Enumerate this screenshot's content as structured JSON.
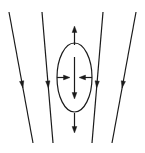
{
  "figure": {
    "width": 145,
    "height": 153,
    "background_color": "#ffffff",
    "stroke_color": "#1a1a1a",
    "line_width": 1.2
  },
  "field_lines": {
    "label": "field-lines",
    "count": 4,
    "stroke_color": "#1a1a1a",
    "lines": [
      {
        "name": "field-line-1",
        "x1": 9,
        "y1": 12,
        "x2": 33,
        "y2": 143,
        "arrow_t": 0.58,
        "direction": "down"
      },
      {
        "name": "field-line-2",
        "x1": 42,
        "y1": 12,
        "x2": 53,
        "y2": 143,
        "arrow_t": 0.58,
        "direction": "down"
      },
      {
        "name": "field-line-3",
        "x1": 103,
        "y1": 12,
        "x2": 92,
        "y2": 143,
        "arrow_t": 0.58,
        "direction": "down"
      },
      {
        "name": "field-line-4",
        "x1": 136,
        "y1": 12,
        "x2": 112,
        "y2": 143,
        "arrow_t": 0.58,
        "direction": "down"
      }
    ]
  },
  "ellipse": {
    "name": "deformation-ellipse",
    "cx": 74.5,
    "cy": 77.5,
    "rx": 17.5,
    "ry": 34.5,
    "fill": "none",
    "stroke_color": "#1a1a1a"
  },
  "force_arrows": {
    "label": "force-arrows",
    "arrows": [
      {
        "name": "arrow-up-outside",
        "x1": 74.5,
        "y1": 45,
        "x2": 74.5,
        "y2": 26,
        "direction": "up",
        "position": "above-ellipse"
      },
      {
        "name": "arrow-down-outside",
        "x1": 74.5,
        "y1": 113,
        "x2": 74.5,
        "y2": 133,
        "direction": "down",
        "position": "below-ellipse"
      },
      {
        "name": "arrow-down-inside",
        "x1": 74.5,
        "y1": 57,
        "x2": 74.5,
        "y2": 99,
        "direction": "down",
        "position": "inside-ellipse-vertical"
      },
      {
        "name": "arrow-left-inward",
        "x1": 57,
        "y1": 77.5,
        "x2": 70,
        "y2": 77.5,
        "direction": "right",
        "position": "inside-ellipse-from-left"
      },
      {
        "name": "arrow-right-inward",
        "x1": 92,
        "y1": 77.5,
        "x2": 79,
        "y2": 77.5,
        "direction": "left",
        "position": "inside-ellipse-from-right"
      }
    ]
  }
}
